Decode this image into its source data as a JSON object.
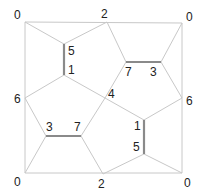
{
  "diagram": {
    "type": "pentagonal-tiling-graph",
    "vertices": {
      "top_left": {
        "x": 25,
        "y": 22,
        "label": "0"
      },
      "top_mid": {
        "x": 107,
        "y": 22,
        "label": "2"
      },
      "top_right": {
        "x": 182,
        "y": 23,
        "label": "0"
      },
      "left_mid": {
        "x": 25,
        "y": 98,
        "label": "6"
      },
      "right_mid": {
        "x": 182,
        "y": 98,
        "label": "6"
      },
      "center": {
        "x": 105,
        "y": 98,
        "label": "4"
      },
      "bottom_left": {
        "x": 25,
        "y": 173,
        "label": "0"
      },
      "bottom_mid": {
        "x": 103,
        "y": 174,
        "label": "2"
      },
      "bottom_right": {
        "x": 182,
        "y": 173,
        "label": "0"
      },
      "lv_top": {
        "x": 64,
        "y": 44,
        "label": "5"
      },
      "lv_bottom": {
        "x": 64,
        "y": 75,
        "label": "1"
      },
      "tr_left": {
        "x": 126,
        "y": 62,
        "label": "7"
      },
      "tr_right": {
        "x": 161,
        "y": 62,
        "label": "3"
      },
      "bl_left": {
        "x": 46,
        "y": 136,
        "label": "3"
      },
      "bl_right": {
        "x": 81,
        "y": 136,
        "label": "7"
      },
      "rv_top": {
        "x": 144,
        "y": 120,
        "label": "1"
      },
      "rv_bottom": {
        "x": 144,
        "y": 154,
        "label": "5"
      }
    },
    "labels": [
      {
        "text": "0",
        "x": 14,
        "y": 19
      },
      {
        "text": "2",
        "x": 101,
        "y": 18
      },
      {
        "text": "0",
        "x": 186,
        "y": 21
      },
      {
        "text": "5",
        "x": 68,
        "y": 55
      },
      {
        "text": "1",
        "x": 68,
        "y": 74
      },
      {
        "text": "7",
        "x": 125,
        "y": 76
      },
      {
        "text": "3",
        "x": 150,
        "y": 76
      },
      {
        "text": "6",
        "x": 14,
        "y": 103
      },
      {
        "text": "4",
        "x": 108,
        "y": 98
      },
      {
        "text": "6",
        "x": 186,
        "y": 105
      },
      {
        "text": "3",
        "x": 46,
        "y": 131
      },
      {
        "text": "7",
        "x": 74,
        "y": 131
      },
      {
        "text": "1",
        "x": 134,
        "y": 130
      },
      {
        "text": "5",
        "x": 133,
        "y": 151
      },
      {
        "text": "0",
        "x": 14,
        "y": 186
      },
      {
        "text": "2",
        "x": 98,
        "y": 188
      },
      {
        "text": "0",
        "x": 184,
        "y": 187
      }
    ],
    "edges": [
      [
        "top_left",
        "top_right"
      ],
      [
        "top_left",
        "bottom_left"
      ],
      [
        "top_right",
        "bottom_right"
      ],
      [
        "bottom_left",
        "bottom_right"
      ],
      [
        "top_left",
        "lv_top"
      ],
      [
        "lv_top",
        "top_mid"
      ],
      [
        "top_mid",
        "tr_left"
      ],
      [
        "tr_right",
        "top_right"
      ],
      [
        "tr_right",
        "right_mid"
      ],
      [
        "lv_bottom",
        "left_mid"
      ],
      [
        "lv_bottom",
        "center"
      ],
      [
        "center",
        "tr_left"
      ],
      [
        "center",
        "rv_top"
      ],
      [
        "center",
        "bl_right"
      ],
      [
        "left_mid",
        "bl_left"
      ],
      [
        "bl_left",
        "bottom_left"
      ],
      [
        "bl_right",
        "bottom_mid"
      ],
      [
        "right_mid",
        "rv_top"
      ],
      [
        "rv_bottom",
        "bottom_mid"
      ],
      [
        "rv_bottom",
        "bottom_right"
      ]
    ],
    "bold_edges": [
      [
        "lv_top",
        "lv_bottom"
      ],
      [
        "tr_left",
        "tr_right"
      ],
      [
        "bl_left",
        "bl_right"
      ],
      [
        "rv_top",
        "rv_bottom"
      ]
    ],
    "colors": {
      "edge": "#c8c8c8",
      "bold_edge": "#8a8a8a",
      "label": "#222222",
      "background": "#ffffff"
    }
  }
}
